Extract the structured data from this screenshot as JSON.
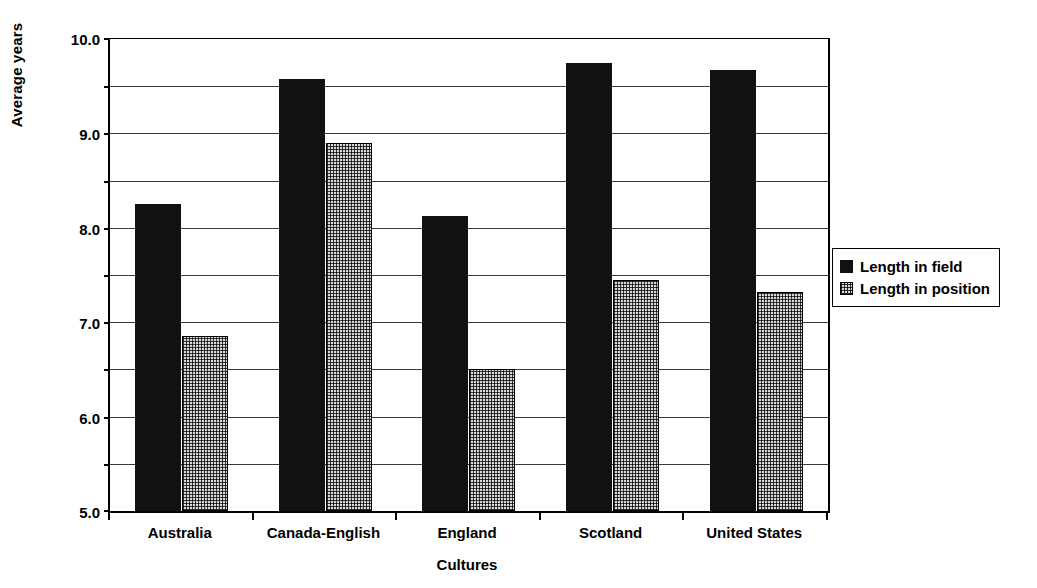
{
  "chart_data": {
    "type": "bar",
    "title": "",
    "xlabel": "Cultures",
    "ylabel": "Average years",
    "ylim": [
      0.0,
      10.0
    ],
    "ytick_labels": [
      "10.0",
      "9.0",
      "8.0",
      "7.0",
      "6.0",
      "5.0",
      "4.0",
      "3.0",
      "2.0",
      "1.0",
      "0.0"
    ],
    "ytick_values": [
      10.0,
      9.0,
      8.0,
      7.0,
      6.0,
      5.0,
      4.0,
      3.0,
      2.0,
      1.0,
      0.0
    ],
    "grid": true,
    "legend_position": "right",
    "categories": [
      "Australia",
      "Canada-English",
      "England",
      "Scotland",
      "United States"
    ],
    "series": [
      {
        "name": "Length in field",
        "fill": "solid-black",
        "color": "#111111",
        "values": [
          6.5,
          9.15,
          6.25,
          9.5,
          9.35
        ]
      },
      {
        "name": "Length in position",
        "fill": "dotted-grey",
        "color": "#d8d8d8",
        "values": [
          3.7,
          7.8,
          3.0,
          4.9,
          4.65
        ]
      }
    ]
  }
}
